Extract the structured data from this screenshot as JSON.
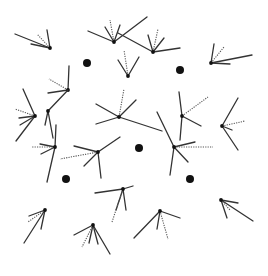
{
  "diagram": {
    "width": 268,
    "height": 276,
    "colors": {
      "background": "#ffffff",
      "line": "#333333",
      "node": "#111111",
      "dotted": "#555555"
    },
    "large_dots": [
      {
        "x": 87,
        "y": 63,
        "r": 4
      },
      {
        "x": 180,
        "y": 70,
        "r": 4
      },
      {
        "x": 139,
        "y": 148,
        "r": 4
      },
      {
        "x": 66,
        "y": 179,
        "r": 4
      },
      {
        "x": 190,
        "y": 179,
        "r": 4
      }
    ],
    "stars": [
      {
        "cx": 50,
        "cy": 48,
        "solid": [
          [
            15,
            34
          ],
          [
            31,
            44
          ],
          [
            47,
            30
          ]
        ],
        "dotted": [
          [
            37,
            34
          ]
        ]
      },
      {
        "cx": 114,
        "cy": 42,
        "solid": [
          [
            88,
            31
          ],
          [
            105,
            27
          ],
          [
            120,
            25
          ],
          [
            147,
            17
          ]
        ],
        "dotted": [
          [
            110,
            20
          ]
        ]
      },
      {
        "cx": 153,
        "cy": 52,
        "solid": [
          [
            148,
            35
          ],
          [
            164,
            38
          ],
          [
            180,
            48
          ],
          [
            118,
            33
          ]
        ],
        "dotted": [
          [
            158,
            29
          ]
        ]
      },
      {
        "cx": 128,
        "cy": 76,
        "solid": [
          [
            118,
            60
          ],
          [
            139,
            57
          ]
        ],
        "dotted": [
          [
            124,
            50
          ]
        ]
      },
      {
        "cx": 211,
        "cy": 63,
        "solid": [
          [
            214,
            44
          ],
          [
            252,
            55
          ],
          [
            230,
            64
          ]
        ],
        "dotted": [
          [
            224,
            47
          ]
        ]
      },
      {
        "cx": 68,
        "cy": 90,
        "solid": [
          [
            69,
            66
          ],
          [
            48,
            93
          ]
        ],
        "dotted": [
          [
            49,
            79
          ]
        ]
      },
      {
        "cx": 35,
        "cy": 116,
        "solid": [
          [
            23,
            89
          ],
          [
            16,
            141
          ],
          [
            20,
            125
          ],
          [
            19,
            118
          ]
        ],
        "dotted": [
          [
            15,
            109
          ]
        ]
      },
      {
        "cx": 48,
        "cy": 111,
        "solid": [
          [
            45,
            125
          ],
          [
            53,
            138
          ],
          [
            68,
            90
          ]
        ],
        "dotted": []
      },
      {
        "cx": 119,
        "cy": 117,
        "solid": [
          [
            96,
            104
          ],
          [
            136,
            100
          ],
          [
            96,
            124
          ],
          [
            162,
            131
          ]
        ],
        "dotted": [
          [
            124,
            89
          ]
        ]
      },
      {
        "cx": 98,
        "cy": 152,
        "solid": [
          [
            74,
            146
          ],
          [
            84,
            166
          ],
          [
            101,
            178
          ],
          [
            120,
            137
          ]
        ],
        "dotted": [
          [
            60,
            159
          ]
        ]
      },
      {
        "cx": 182,
        "cy": 116,
        "solid": [
          [
            179,
            92
          ],
          [
            201,
            126
          ],
          [
            180,
            140
          ]
        ],
        "dotted": [
          [
            208,
            97
          ]
        ]
      },
      {
        "cx": 222,
        "cy": 126,
        "solid": [
          [
            238,
            98
          ],
          [
            238,
            150
          ],
          [
            232,
            130
          ]
        ],
        "dotted": [
          [
            245,
            121
          ]
        ]
      },
      {
        "cx": 174,
        "cy": 147,
        "solid": [
          [
            157,
            112
          ],
          [
            195,
            142
          ],
          [
            170,
            175
          ],
          [
            188,
            162
          ]
        ],
        "dotted": [
          [
            213,
            147
          ]
        ]
      },
      {
        "cx": 55,
        "cy": 147,
        "solid": [
          [
            40,
            144
          ],
          [
            47,
            182
          ],
          [
            41,
            154
          ],
          [
            56,
            125
          ]
        ],
        "dotted": [
          [
            31,
            147
          ]
        ]
      },
      {
        "cx": 123,
        "cy": 189,
        "solid": [
          [
            95,
            193
          ],
          [
            133,
            186
          ],
          [
            116,
            210
          ],
          [
            126,
            210
          ]
        ],
        "dotted": [
          [
            112,
            222
          ]
        ]
      },
      {
        "cx": 45,
        "cy": 210,
        "solid": [
          [
            29,
            216
          ],
          [
            24,
            243
          ],
          [
            41,
            229
          ]
        ],
        "dotted": [
          [
            28,
            222
          ]
        ]
      },
      {
        "cx": 93,
        "cy": 225,
        "solid": [
          [
            74,
            235
          ],
          [
            89,
            243
          ],
          [
            110,
            254
          ],
          [
            98,
            244
          ]
        ],
        "dotted": [
          [
            82,
            247
          ]
        ]
      },
      {
        "cx": 160,
        "cy": 211,
        "solid": [
          [
            180,
            218
          ],
          [
            134,
            238
          ],
          [
            157,
            229
          ]
        ],
        "dotted": [
          [
            168,
            239
          ]
        ]
      },
      {
        "cx": 221,
        "cy": 200,
        "solid": [
          [
            238,
            203
          ],
          [
            253,
            221
          ],
          [
            227,
            218
          ]
        ],
        "dotted": [
          [
            230,
            210
          ]
        ]
      }
    ]
  }
}
